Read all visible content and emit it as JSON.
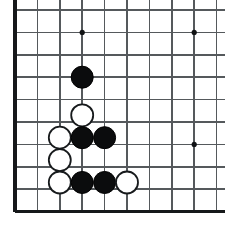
{
  "board": {
    "title": "Go board position",
    "game": "go",
    "grid": {
      "columns": 10,
      "rows": 10,
      "spacing": 22.4,
      "origin_x": 15,
      "origin_y": 10,
      "line_color": "#55595c",
      "edge_color": "#16181a",
      "background_color": "#ffffff"
    },
    "edges": {
      "left": true,
      "right": false,
      "top": false,
      "bottom": true
    },
    "star_points": [
      {
        "col": 3,
        "row": 1
      },
      {
        "col": 8,
        "row": 1
      },
      {
        "col": 3,
        "row": 6
      },
      {
        "col": 8,
        "row": 6
      }
    ],
    "stones": [
      {
        "color": "black",
        "col": 3,
        "row": 3,
        "label": "black-stone-c3r3"
      },
      {
        "color": "white",
        "col": 3,
        "row": 4.7,
        "label": "white-stone-c3r5"
      },
      {
        "color": "white",
        "col": 2,
        "row": 5.7,
        "label": "white-stone-c2r6"
      },
      {
        "color": "black",
        "col": 3,
        "row": 5.7,
        "label": "black-stone-c3r6"
      },
      {
        "color": "black",
        "col": 4,
        "row": 5.7,
        "label": "black-stone-c4r6"
      },
      {
        "color": "white",
        "col": 2,
        "row": 6.7,
        "label": "white-stone-c2r7"
      },
      {
        "color": "white",
        "col": 2,
        "row": 7.7,
        "label": "white-stone-c2r8"
      },
      {
        "color": "black",
        "col": 3,
        "row": 7.7,
        "label": "black-stone-c3r8"
      },
      {
        "color": "black",
        "col": 4,
        "row": 7.7,
        "label": "black-stone-c4r8"
      },
      {
        "color": "white",
        "col": 5,
        "row": 7.7,
        "label": "white-stone-c5r8"
      }
    ],
    "stone_radius": 11,
    "star_radius": 2.6,
    "colors": {
      "black_stone": "#0b0c0d",
      "white_stone_fill": "#ffffff",
      "white_stone_outline": "#171a1c"
    }
  }
}
